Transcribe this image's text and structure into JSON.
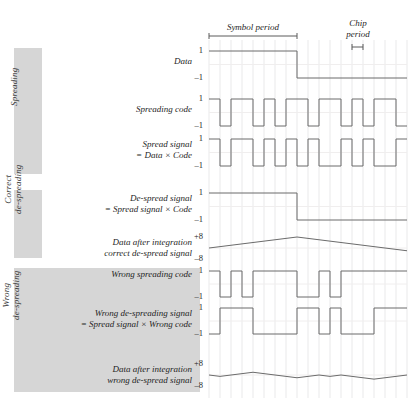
{
  "figure": {
    "grid": {
      "x_start": 209,
      "x_end": 407,
      "chip_width": 11,
      "chips": 18,
      "color": "#e9e9ea",
      "wave_color": "#6b6b6b"
    },
    "annotations": {
      "symbol_period": {
        "label": "Symbol period",
        "x_start": 209,
        "x_end": 297,
        "chips_spanned": 8
      },
      "chip_period": {
        "label_line1": "Chip",
        "label_line2": "period",
        "x_start": 352,
        "x_end": 363,
        "chips_spanned": 1
      }
    },
    "bands": [
      {
        "name": "Spreading",
        "label": "Spreading",
        "x": 14,
        "y": 48,
        "w": 28,
        "h": 126
      },
      {
        "name": "Correct de-spreading",
        "label_line1": "Correct",
        "label_line2": "de-spreading",
        "x": 14,
        "y": 190,
        "w": 28,
        "h": 68
      },
      {
        "name": "Wrong de-spreading",
        "label_line1": "Wrong",
        "label_line2": "de-spreading",
        "x": 14,
        "y": 268,
        "w": 186,
        "h": 124
      }
    ]
  },
  "chart_data": {
    "type": "line",
    "xlabel": "",
    "ylabel": "",
    "grid": true,
    "legend": "none",
    "x": {
      "unit": "chip",
      "range": [
        0,
        18
      ],
      "chips_per_symbol": 8,
      "symbols": 2
    },
    "series": [
      {
        "name": "Data",
        "label": "Data",
        "label_line2": "",
        "ylim": [
          -1,
          1
        ],
        "ytick_top": "1",
        "ytick_bottom": "–1",
        "kind": "square",
        "values": [
          1,
          1,
          1,
          1,
          1,
          1,
          1,
          1,
          -1,
          -1,
          -1,
          -1,
          -1,
          -1,
          -1,
          -1,
          -1,
          -1
        ]
      },
      {
        "name": "Spreading code",
        "label": "Spreading code",
        "label_line2": "",
        "ylim": [
          -1,
          1
        ],
        "ytick_top": "1",
        "ytick_bottom": "–1",
        "kind": "square",
        "values": [
          1,
          -1,
          1,
          1,
          -1,
          1,
          -1,
          1,
          1,
          -1,
          1,
          1,
          -1,
          1,
          -1,
          1,
          1,
          -1
        ]
      },
      {
        "name": "Spread signal",
        "label": "Spread signal",
        "label_line2": "= Data × Code",
        "ylim": [
          -1,
          1
        ],
        "ytick_top": "1",
        "ytick_bottom": "–1",
        "kind": "square",
        "values": [
          1,
          -1,
          1,
          1,
          -1,
          1,
          -1,
          1,
          -1,
          1,
          -1,
          -1,
          1,
          -1,
          1,
          -1,
          -1,
          1
        ]
      },
      {
        "name": "De-spread signal",
        "label": "De-spread signal",
        "label_line2": "= Spread signal × Code",
        "ylim": [
          -1,
          1
        ],
        "ytick_top": "1",
        "ytick_bottom": "–1",
        "kind": "square",
        "values": [
          1,
          1,
          1,
          1,
          1,
          1,
          1,
          1,
          -1,
          -1,
          -1,
          -1,
          -1,
          -1,
          -1,
          -1,
          -1,
          -1
        ]
      },
      {
        "name": "Data after integration correct",
        "label": "Data after integration",
        "label_line2": "correct de-spread signal",
        "ylim": [
          -8,
          8
        ],
        "ytick_top": "+8",
        "ytick_bottom": "–8",
        "kind": "integrate",
        "values": [
          1,
          2,
          3,
          4,
          5,
          6,
          7,
          8,
          7,
          6,
          5,
          4,
          3,
          2,
          1,
          0,
          -1,
          -2
        ],
        "start": 0
      },
      {
        "name": "Wrong spreading code",
        "label": "Wrong spreading code",
        "label_line2": "",
        "ylim": [
          -1,
          1
        ],
        "ytick_top": "1",
        "ytick_bottom": "–1",
        "kind": "square",
        "values": [
          1,
          -1,
          1,
          -1,
          1,
          1,
          1,
          1,
          -1,
          -1,
          1,
          -1,
          1,
          1,
          1,
          1,
          1,
          1
        ]
      },
      {
        "name": "Wrong de-spreading signal",
        "label": "Wrong de-spreading signal",
        "label_line2": "= Spread signal × Wrong code",
        "ylim": [
          -1,
          1
        ],
        "ytick_top": "1",
        "ytick_bottom": "–1",
        "kind": "square",
        "values": [
          -1,
          1,
          1,
          1,
          -1,
          -1,
          -1,
          -1,
          1,
          1,
          -1,
          1,
          -1,
          -1,
          -1,
          1,
          1,
          1
        ]
      },
      {
        "name": "Data after integration wrong",
        "label": "Data after integration",
        "label_line2": "wrong de-spread signal",
        "ylim": [
          -8,
          8
        ],
        "ytick_top": "+8",
        "ytick_bottom": "–8",
        "kind": "integrate",
        "values": [
          -1,
          0,
          1,
          2,
          1,
          0,
          -1,
          -2,
          -1,
          0,
          -1,
          0,
          -1,
          -2,
          -3,
          -2,
          -1,
          0
        ],
        "start": 0
      }
    ],
    "rows_layout": [
      {
        "series": 0,
        "y_top": 51,
        "y_bot": 78,
        "label_y": 58,
        "label_x": 180
      },
      {
        "series": 1,
        "y_top": 99,
        "y_bot": 126,
        "label_y": 106,
        "label_x": 180
      },
      {
        "series": 2,
        "y_top": 139,
        "y_bot": 166,
        "label_y": 141,
        "label_x": 180
      },
      {
        "series": 3,
        "y_top": 193,
        "y_bot": 220,
        "label_y": 195,
        "label_x": 180
      },
      {
        "series": 4,
        "y_top": 237,
        "y_bot": 259,
        "label_y": 239,
        "label_x": 180
      },
      {
        "series": 5,
        "y_top": 271,
        "y_bot": 297,
        "label_y": 271,
        "label_x": 180
      },
      {
        "series": 6,
        "y_top": 308,
        "y_bot": 334,
        "label_y": 310,
        "label_x": 180
      },
      {
        "series": 7,
        "y_top": 364,
        "y_bot": 386,
        "label_y": 366,
        "label_x": 180
      }
    ]
  }
}
